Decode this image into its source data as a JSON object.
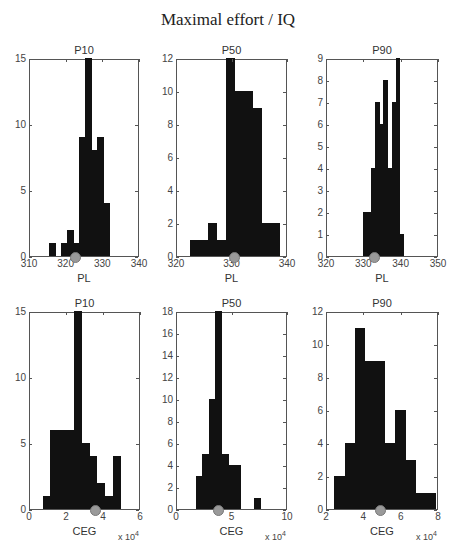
{
  "title": "Maximal effort / IQ",
  "chart_data": [
    {
      "type": "bar",
      "title": "P10",
      "xlabel": "PL",
      "ylabel": "",
      "xlim": [
        310,
        340
      ],
      "ylim": [
        0,
        15
      ],
      "xticks": [
        310,
        320,
        330,
        340
      ],
      "yticks": [
        0,
        5,
        10,
        15
      ],
      "bin_width": 1.63,
      "bins": [
        315.3,
        316.9,
        318.5,
        320.2,
        321.8,
        323.4,
        325.1,
        326.7,
        328.3,
        330.0,
        331.6
      ],
      "values": [
        1,
        0,
        1,
        2,
        1,
        9,
        15,
        8,
        9,
        4,
        0
      ],
      "marker_x": 322.6,
      "grid": false
    },
    {
      "type": "bar",
      "title": "P50",
      "xlabel": "PL",
      "ylabel": "",
      "xlim": [
        320,
        340
      ],
      "ylim": [
        0,
        12
      ],
      "xticks": [
        320,
        330,
        340
      ],
      "yticks": [
        0,
        2,
        4,
        6,
        8,
        10,
        12
      ],
      "bin_width": 1.6,
      "bins": [
        322.4,
        324.0,
        325.6,
        327.2,
        328.8,
        330.4,
        332.0,
        333.6,
        335.2,
        336.8
      ],
      "values": [
        1,
        1,
        2,
        1,
        12,
        10,
        10,
        9,
        2,
        2
      ],
      "marker_x": 330.6,
      "grid": false
    },
    {
      "type": "bar",
      "title": "P90",
      "xlabel": "PL",
      "ylabel": "",
      "xlim": [
        320,
        350
      ],
      "ylim": [
        0,
        9
      ],
      "xticks": [
        320,
        330,
        340,
        350
      ],
      "yticks": [
        0,
        1,
        2,
        3,
        4,
        5,
        6,
        7,
        8,
        9
      ],
      "bin_width": 1.1,
      "bins": [
        329.6,
        330.7,
        331.8,
        332.9,
        334.0,
        335.1,
        336.2,
        337.3,
        338.4,
        339.5
      ],
      "values": [
        2,
        2,
        4,
        7,
        6,
        8,
        4,
        7,
        9,
        1
      ],
      "marker_x": 333.0,
      "grid": false
    },
    {
      "type": "bar",
      "title": "P10",
      "xlabel": "CEG",
      "ylabel": "",
      "x_multiplier": "x 10^4",
      "xlim": [
        0,
        6
      ],
      "ylim": [
        0,
        15
      ],
      "xticks": [
        0,
        2,
        4,
        6
      ],
      "yticks": [
        0,
        5,
        10,
        15
      ],
      "bin_width": 0.42,
      "bins": [
        0.68,
        1.1,
        1.52,
        1.94,
        2.36,
        2.78,
        3.2,
        3.62,
        4.04,
        4.46
      ],
      "values": [
        1,
        6,
        6,
        6,
        15,
        5,
        4,
        2,
        1,
        4
      ],
      "marker_x": 3.6,
      "grid": false
    },
    {
      "type": "bar",
      "title": "P50",
      "xlabel": "CEG",
      "ylabel": "",
      "x_multiplier": "x 10^4",
      "xlim": [
        0,
        10
      ],
      "ylim": [
        0,
        18
      ],
      "xticks": [
        0,
        5,
        10
      ],
      "yticks": [
        0,
        2,
        4,
        6,
        8,
        10,
        12,
        14,
        16,
        18
      ],
      "bin_width": 0.58,
      "bins": [
        1.7,
        2.28,
        2.86,
        3.44,
        4.02,
        4.6,
        5.18,
        5.76,
        6.34,
        6.92
      ],
      "values": [
        3,
        5,
        10,
        18,
        5,
        4,
        4,
        0,
        0,
        1
      ],
      "marker_x": 3.8,
      "grid": false
    },
    {
      "type": "bar",
      "title": "P90",
      "xlabel": "CEG",
      "ylabel": "",
      "x_multiplier": "x 10^4",
      "xlim": [
        2,
        8
      ],
      "ylim": [
        0,
        12
      ],
      "xticks": [
        2,
        4,
        6,
        8
      ],
      "yticks": [
        0,
        2,
        4,
        6,
        8,
        10,
        12
      ],
      "bin_width": 0.54,
      "bins": [
        2.4,
        2.94,
        3.48,
        4.02,
        4.56,
        5.1,
        5.64,
        6.18,
        6.72,
        7.26
      ],
      "values": [
        2,
        4,
        11,
        9,
        9,
        4,
        6,
        3,
        1,
        1
      ],
      "marker_x": 4.9,
      "grid": false
    }
  ],
  "layout": [
    {
      "left": 29,
      "top": 59,
      "width": 110,
      "height": 198
    },
    {
      "left": 176,
      "top": 59,
      "width": 111,
      "height": 198
    },
    {
      "left": 326,
      "top": 59,
      "width": 112,
      "height": 198
    },
    {
      "left": 29,
      "top": 312,
      "width": 111,
      "height": 198
    },
    {
      "left": 176,
      "top": 312,
      "width": 111,
      "height": 198
    },
    {
      "left": 326,
      "top": 312,
      "width": 112,
      "height": 198
    }
  ],
  "colors": {
    "bar": "#111111",
    "marker": "#9a9a9a",
    "axis": "#555555"
  }
}
